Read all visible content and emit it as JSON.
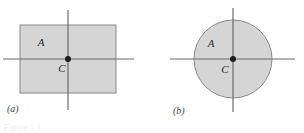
{
  "figure": {
    "width": 304,
    "height": 133,
    "background_color": "#ffffff",
    "shape_fill_color": "#d5d5d5",
    "shape_stroke_color": "#8a8a8a",
    "axis_color": "#6b6b6b",
    "text_color": "#2b2b2b",
    "caption_color": "#4a4a4a",
    "bottom_caption": "Figure 1.1"
  },
  "panels": [
    {
      "id": "a",
      "caption": "(a)",
      "shape": "rectangle",
      "region_label": "A",
      "center_label": "C",
      "geometry": {
        "rect_x": 20,
        "rect_y": 25,
        "rect_width": 96,
        "rect_height": 68,
        "center_x": 68,
        "center_y": 59,
        "h_axis_x1": 3,
        "h_axis_x2": 134,
        "v_axis_y1": 10,
        "v_axis_y2": 110,
        "label_a_x": 41,
        "label_a_y": 46,
        "label_c_x": 62,
        "label_c_y": 72
      }
    },
    {
      "id": "b",
      "caption": "(b)",
      "shape": "circle",
      "region_label": "A",
      "center_label": "C",
      "geometry": {
        "center_x": 81,
        "center_y": 59,
        "radius": 39,
        "h_axis_x1": 18,
        "h_axis_x2": 143,
        "v_axis_y1": 8,
        "v_axis_y2": 112,
        "label_a_x": 59,
        "label_a_y": 47,
        "label_c_x": 73,
        "label_c_y": 73
      }
    }
  ]
}
